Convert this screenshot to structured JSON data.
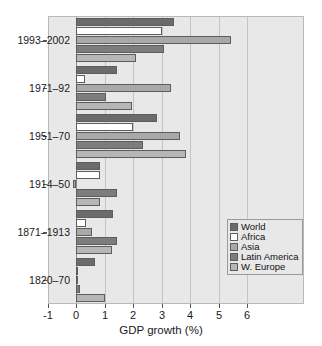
{
  "chart_data": {
    "type": "bar",
    "orientation": "horizontal",
    "title": "",
    "xlabel": "GDP growth (%)",
    "ylabel": "",
    "xlim": [
      -1,
      6
    ],
    "xticks": [
      -1,
      0,
      1,
      2,
      3,
      4,
      5,
      6
    ],
    "xticklabels": [
      "-1",
      "0",
      "1",
      "2",
      "3",
      "4",
      "5",
      "6"
    ],
    "grid": true,
    "grid_axis": "x",
    "legend_position": "center-right",
    "categories": [
      "1993-2002",
      "1971-92",
      "1951-70",
      "1914-50",
      "1871-1913",
      "1820-70"
    ],
    "series": [
      {
        "name": "World",
        "color": "#6b6b6b",
        "values": [
          3.45,
          1.45,
          2.85,
          0.85,
          1.3,
          0.65
        ]
      },
      {
        "name": "Africa",
        "color": "#ffffff",
        "values": [
          3.0,
          0.3,
          2.0,
          0.85,
          0.35,
          0.05
        ]
      },
      {
        "name": "Asia",
        "color": "#a9a9a9",
        "values": [
          5.45,
          3.35,
          3.65,
          -0.1,
          0.55,
          0.0
        ]
      },
      {
        "name": "Latin America",
        "color": "#7d7d7d",
        "values": [
          3.1,
          1.05,
          2.35,
          1.45,
          1.45,
          0.15
        ]
      },
      {
        "name": "W. Europe",
        "color": "#b6b6b6",
        "values": [
          2.1,
          1.95,
          3.85,
          0.85,
          1.25,
          1.0
        ]
      }
    ]
  },
  "legend": {
    "items": [
      {
        "label": "World"
      },
      {
        "label": "Africa"
      },
      {
        "label": "Asia"
      },
      {
        "label": "Latin America"
      },
      {
        "label": "W. Europe"
      }
    ]
  },
  "axis": {
    "x_label": "GDP growth (%)"
  }
}
